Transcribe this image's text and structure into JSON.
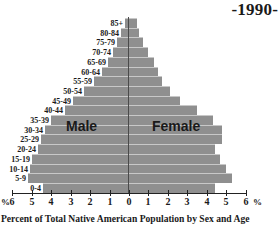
{
  "header": {
    "year_label": "-1990-"
  },
  "caption": "Percent of Total Native American Population by Sex and Age",
  "labels": {
    "male": "Male",
    "female": "Female",
    "percent_left": "%",
    "percent_right": "%"
  },
  "axis": {
    "ticks": [
      "6",
      "5",
      "4",
      "3",
      "2",
      "1",
      "0",
      "1",
      "2",
      "3",
      "4",
      "5",
      "6"
    ]
  },
  "colors": {
    "bar": "#8f8f8f",
    "bar_highlight": "#c8c8c8",
    "axis": "#222222",
    "text": "#1a1a1a"
  },
  "chart_data": {
    "type": "bar",
    "orientation": "horizontal",
    "subtype": "population-pyramid",
    "title": "-1990-",
    "xlabel": "Percent of Total Native American Population by Sex and Age",
    "ylabel": "Age group",
    "xlim": [
      -6,
      6
    ],
    "grid": false,
    "categories": [
      "85+",
      "80-84",
      "75-79",
      "70-74",
      "65-69",
      "60-64",
      "55-59",
      "50-54",
      "45-49",
      "40-44",
      "35-39",
      "30-34",
      "25-29",
      "20-24",
      "15-19",
      "10-14",
      "5-9",
      "0-4"
    ],
    "series": [
      {
        "name": "Male",
        "side": "left",
        "values": [
          0.2,
          0.4,
          0.6,
          0.8,
          1.1,
          1.4,
          1.8,
          2.3,
          2.9,
          3.3,
          4.0,
          4.3,
          4.5,
          4.7,
          5.0,
          5.1,
          5.2,
          4.4
        ]
      },
      {
        "name": "Female",
        "side": "right",
        "values": [
          0.4,
          0.5,
          0.7,
          1.0,
          1.3,
          1.5,
          1.7,
          2.1,
          2.6,
          3.5,
          4.3,
          4.8,
          4.8,
          4.4,
          4.7,
          5.0,
          5.3,
          4.4
        ]
      }
    ],
    "legend": [
      "Male",
      "Female"
    ]
  }
}
